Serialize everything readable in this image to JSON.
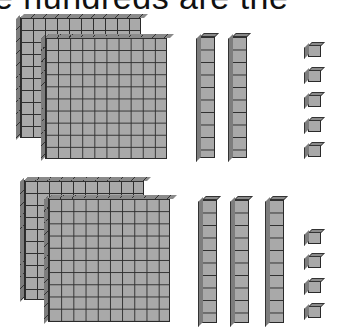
{
  "caption": "e hundreds are the",
  "groups": [
    {
      "name": "top-group",
      "value": 225,
      "hundreds_flats": 2,
      "tens_rods": 2,
      "ones_units": 5
    },
    {
      "name": "bottom-group",
      "value": 234,
      "hundreds_flats": 2,
      "tens_rods": 3,
      "ones_units": 4
    }
  ],
  "colors": {
    "block_fill": "#a9a9a9",
    "grid_line": "#2e2e2e",
    "background": "#ffffff"
  }
}
